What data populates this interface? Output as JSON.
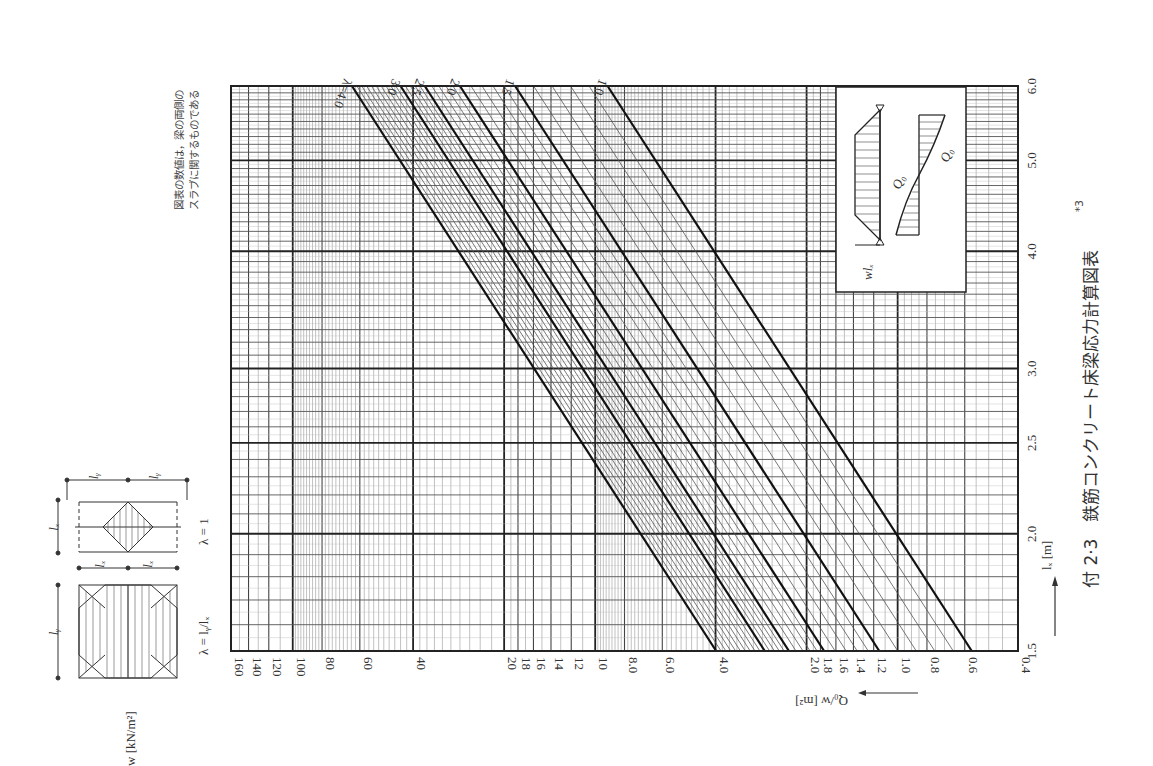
{
  "figure": {
    "caption": "付 2·3　鉄筋コンクリート床梁応力計算図表",
    "caption_sup": "*3",
    "note_line1": "図表の数値は，梁の両側の",
    "note_line2": "スラブに関するものである",
    "orientation": "rotated 90° counter-clockwise"
  },
  "axes": {
    "q_axis_label": "Q₀/w  [m²]",
    "lx_axis_label": "lₓ  [m]",
    "w_label": "w  [kN/m²]",
    "q_ticks": [
      "160",
      "140",
      "120",
      "100",
      "80",
      "60",
      "40",
      "20",
      "18",
      "16",
      "14",
      "12",
      "10",
      "8.0",
      "6.0",
      "4.0",
      "2.0",
      "1.8",
      "1.6",
      "1.4",
      "1.2",
      "1.0",
      "0.8",
      "0.6",
      "0.4"
    ],
    "lx_ticks": [
      "1.5",
      "2.0",
      "2.5",
      "3.0",
      "4.0",
      "5.0",
      "6.0"
    ]
  },
  "lambda_labels": [
    "λ=4.0",
    "3.0",
    "2.5",
    "2.0",
    "1.5",
    "1.0"
  ],
  "diagrams": {
    "left_slab_label": "λ = lᵧ/lₓ",
    "right_slab_label": "λ = 1",
    "lx": "lₓ",
    "ly": "lᵧ",
    "inset_load": "wlₓ",
    "inset_shear": "Q₀"
  },
  "chart_data": {
    "type": "line",
    "subtitle": "図表の数値は，梁の両側のスラブに関するものである",
    "xlabel": "lₓ [m]",
    "ylabel": "Q₀/w [m²]",
    "xscale": "log",
    "yscale": "log",
    "xlim": [
      1.5,
      6.0
    ],
    "ylim": [
      0.4,
      160
    ],
    "x_ticks": [
      1.5,
      2.0,
      2.5,
      3.0,
      4.0,
      5.0,
      6.0
    ],
    "y_ticks": [
      0.4,
      0.6,
      0.8,
      1.0,
      1.2,
      1.4,
      1.6,
      1.8,
      2.0,
      4.0,
      6.0,
      8.0,
      10,
      12,
      14,
      16,
      18,
      20,
      40,
      60,
      80,
      100,
      120,
      140,
      160
    ],
    "grid": true,
    "legend_position": "inline labels at top end of each line",
    "x": [
      1.5,
      6.0
    ],
    "series": [
      {
        "name": "λ=4.0",
        "values": [
          4.0,
          63.7
        ]
      },
      {
        "name": "λ=3.0",
        "values": [
          2.75,
          44.0
        ]
      },
      {
        "name": "λ=2.5",
        "values": [
          2.29,
          36.6
        ]
      },
      {
        "name": "λ=2.0",
        "values": [
          1.75,
          28.0
        ]
      },
      {
        "name": "λ=1.5",
        "values": [
          1.15,
          18.4
        ]
      },
      {
        "name": "λ=1.0",
        "values": [
          0.57,
          9.1
        ]
      }
    ],
    "annotations": [
      "Intermediate thin lines at λ steps of 0.1 between bold lines",
      "Inset: load diagram wlₓ and shear diagram Q₀"
    ]
  }
}
